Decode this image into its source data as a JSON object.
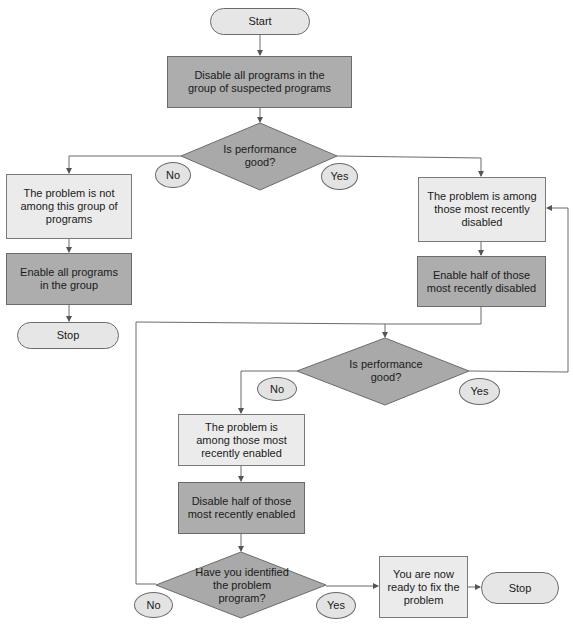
{
  "flowchart": {
    "start": "Start",
    "step_disable_all": "Disable all programs in the group of suspected programs",
    "decision_1": "Is performance good?",
    "decision_1_no": "No",
    "decision_1_yes": "Yes",
    "left_not_among": "The problem is not among this group of programs",
    "left_enable_all": "Enable all programs in the group",
    "left_stop": "Stop",
    "right_among_disabled": "The problem is among those most recently disabled",
    "right_enable_half": "Enable half of those most recently disabled",
    "decision_2": "Is performance good?",
    "decision_2_no": "No",
    "decision_2_yes": "Yes",
    "among_enabled": "The problem is among those most recently enabled",
    "disable_half": "Disable half of those most recently enabled",
    "decision_3": "Have you identified the problem program?",
    "decision_3_no": "No",
    "decision_3_yes": "Yes",
    "ready_to_fix": "You are now ready to fix the problem",
    "final_stop": "Stop"
  },
  "colors": {
    "terminal_fill": "#e6e6e6",
    "process_light_fill": "#ebebeb",
    "process_dark_fill": "#adadad",
    "decision_fill": "#a9a9a9",
    "line": "#6b6b6b"
  }
}
